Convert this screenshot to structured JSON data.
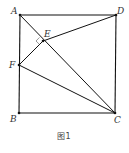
{
  "figure": {
    "caption": "图1",
    "points": {
      "A": {
        "label": "A",
        "x": 20,
        "y": 15
      },
      "B": {
        "label": "B",
        "x": 19,
        "y": 113
      },
      "C": {
        "label": "C",
        "x": 115,
        "y": 113
      },
      "D": {
        "label": "D",
        "x": 116,
        "y": 15
      },
      "E": {
        "label": "E",
        "x": 43,
        "y": 41
      },
      "F": {
        "label": "F",
        "x": 19,
        "y": 65
      }
    },
    "segments": [
      "AD",
      "DC",
      "CB",
      "BA",
      "AC",
      "DE",
      "EF",
      "FC"
    ],
    "right_angle_at": "E",
    "colors": {
      "line": "#111111",
      "background": "#ffffff"
    }
  }
}
